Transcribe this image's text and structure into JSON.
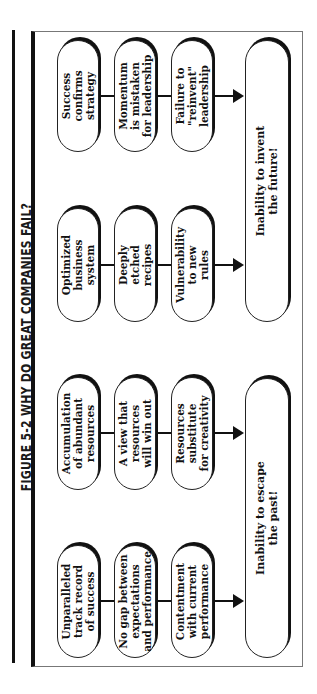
{
  "figure": {
    "title": "FIGURE 5-2  WHY DO GREAT COMPANIES FAIL?",
    "orientation": "rotated 90° counter-clockwise",
    "colors": {
      "ink": "#111111",
      "background": "#ffffff",
      "frame": "#777777"
    }
  },
  "groups": [
    {
      "id": "past-a",
      "steps": [
        "Unparalleled\ntrack record\nof success",
        "No gap between\nexpectations\nand performance",
        "Contentment\nwith current\nperformance"
      ],
      "target": "past"
    },
    {
      "id": "past-b",
      "steps": [
        "Accumulation\nof abundant\nresources",
        "A view that\nresources\nwill win out",
        "Resources\nsubstitute\nfor creativity"
      ],
      "target": "past"
    },
    {
      "id": "future-a",
      "steps": [
        "Optimized\nbusiness\nsystem",
        "Deeply\netched\nrecipes",
        "Vulnerability\nto new\nrules"
      ],
      "target": "future"
    },
    {
      "id": "future-b",
      "steps": [
        "Success\nconfirms\nstrategy",
        "Momentum\nis mistaken\nfor leadership",
        "Failure to\n\"reinvent\"\nleadership"
      ],
      "target": "future"
    }
  ],
  "outcomes": {
    "past": "Inability to escape\nthe past!",
    "future": "Inability to invent\nthe future!"
  }
}
